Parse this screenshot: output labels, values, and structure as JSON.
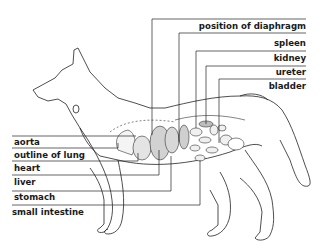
{
  "diagram": {
    "labels_right": [
      {
        "id": "diaphragm",
        "text": "position of diaphragm"
      },
      {
        "id": "spleen",
        "text": "spleen"
      },
      {
        "id": "kidney",
        "text": "kidney"
      },
      {
        "id": "ureter",
        "text": "ureter"
      },
      {
        "id": "bladder",
        "text": "bladder"
      }
    ],
    "labels_left": [
      {
        "id": "aorta",
        "text": "aorta"
      },
      {
        "id": "lung",
        "text": "outline of lung"
      },
      {
        "id": "heart",
        "text": "heart"
      },
      {
        "id": "liver",
        "text": "liver"
      },
      {
        "id": "stomach",
        "text": "stomach"
      },
      {
        "id": "small_intestine",
        "text": "small intestine"
      }
    ],
    "colors": {
      "line": "#222222",
      "organ_fill": "#d8d8d8",
      "background": "#ffffff"
    }
  }
}
